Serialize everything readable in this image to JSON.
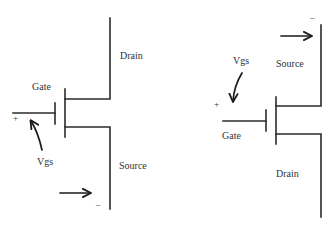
{
  "diagram": {
    "type": "mosfet-terminal-diagrams",
    "colors": {
      "line": "#2b2b2b",
      "text": "#333333",
      "background": "#ffffff"
    },
    "left_transistor": {
      "labels": {
        "gate": "Gate",
        "drain": "Drain",
        "source": "Source",
        "vgs": "Vgs",
        "plus": "+",
        "minus": "–"
      }
    },
    "right_transistor": {
      "labels": {
        "gate": "Gate",
        "drain": "Drain",
        "source": "Source",
        "vgs": "Vgs",
        "plus": "+",
        "minus": "–"
      }
    }
  }
}
